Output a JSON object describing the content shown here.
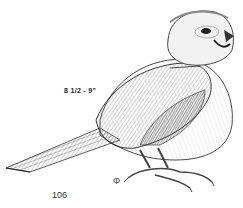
{
  "illustration": {
    "subject": "songbird perched, pen-and-ink drawing",
    "size_label": "8 1/2 - 9\"",
    "signature_glyph": "Φ",
    "colors": {
      "ink": "#222222",
      "shade": "#555555",
      "light": "#bbbbbb",
      "paper": "#ffffff"
    }
  },
  "page": {
    "number": "106"
  }
}
